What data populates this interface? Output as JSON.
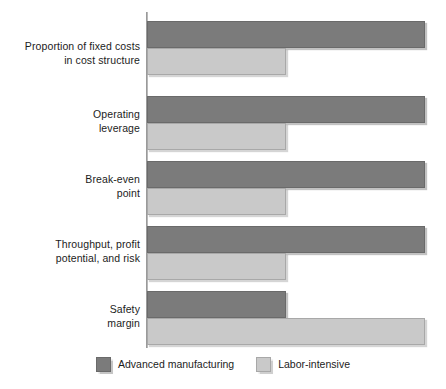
{
  "chart_data": {
    "type": "bar",
    "orientation": "horizontal",
    "title": "",
    "subtitle": "",
    "xlabel": "",
    "ylabel": "",
    "xlim": [
      0,
      100
    ],
    "grid": false,
    "legend_position": "bottom-center",
    "categories": [
      "Proportion of fixed costs\nin cost structure",
      "Operating\nleverage",
      "Break-even\npoint",
      "Throughput, profit\npotential, and risk",
      "Safety\nmargin"
    ],
    "series": [
      {
        "name": "Advanced manufacturing",
        "color": "#7b7b7b",
        "values": [
          100,
          100,
          100,
          100,
          50
        ]
      },
      {
        "name": "Labor-intensive",
        "color": "#c9c9c9",
        "values": [
          50,
          50,
          50,
          50,
          100
        ]
      }
    ],
    "annotations": [],
    "tick_labels": []
  },
  "legend": {
    "items": [
      {
        "label": "Advanced manufacturing",
        "swatch": "dark-gray-swatch",
        "color": "#7b7b7b"
      },
      {
        "label": "Labor-intensive",
        "swatch": "light-gray-swatch",
        "color": "#c9c9c9"
      }
    ]
  },
  "axis": {
    "value_axis_color": "#b9b9b9"
  },
  "geometry": {
    "groups": [
      {
        "top": 21,
        "label_top": 40,
        "dark": {
          "top": 21,
          "height": 27,
          "width": 278
        },
        "light": {
          "top": 48,
          "height": 27,
          "width": 139
        }
      },
      {
        "top": 96,
        "label_top": 108,
        "dark": {
          "top": 96,
          "height": 27,
          "width": 278
        },
        "light": {
          "top": 123,
          "height": 27,
          "width": 139
        }
      },
      {
        "top": 161,
        "label_top": 173,
        "dark": {
          "top": 161,
          "height": 27,
          "width": 278
        },
        "light": {
          "top": 188,
          "height": 27,
          "width": 139
        }
      },
      {
        "top": 226,
        "label_top": 238,
        "dark": {
          "top": 226,
          "height": 27,
          "width": 278
        },
        "light": {
          "top": 253,
          "height": 27,
          "width": 139
        }
      },
      {
        "top": 291,
        "label_top": 303,
        "dark": {
          "top": 291,
          "height": 27,
          "width": 139
        },
        "light": {
          "top": 318,
          "height": 27,
          "width": 278
        }
      }
    ]
  }
}
